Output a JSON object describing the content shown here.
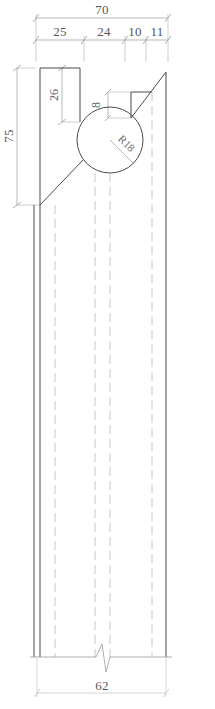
{
  "drawing": {
    "title": "Cross-section profile with R18 circular bore",
    "units": "mm",
    "line_color": "#4a4a4c",
    "dim_color": "#8c8c8e",
    "text_color": "#58585a",
    "hidden_color": "#b8b8ba",
    "background": "#ffffff"
  },
  "dimensions": {
    "overall_width": "70",
    "segment_1": "25",
    "segment_2": "24",
    "segment_3": "10",
    "segment_4": "11",
    "overall_height": "75",
    "top_block_height": "26",
    "notch_height": "8",
    "bore_radius": "R18",
    "bottom_width": "62"
  },
  "labels": {
    "top_total": "70",
    "top_a": "25",
    "top_b": "24",
    "top_c": "10",
    "top_d": "11",
    "left_height": "75",
    "inner_height": "26",
    "notch": "8",
    "radius": "R18",
    "bottom_total": "62"
  }
}
